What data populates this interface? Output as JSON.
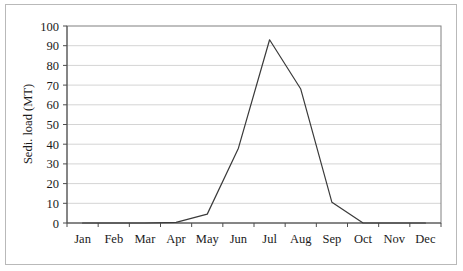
{
  "chart_data": {
    "type": "line",
    "title": "",
    "xlabel": "",
    "ylabel": "Sedi. load (MT)",
    "categories": [
      "Jan",
      "Feb",
      "Mar",
      "Apr",
      "May",
      "Jun",
      "Jul",
      "Aug",
      "Sep",
      "Oct",
      "Nov",
      "Dec"
    ],
    "values": [
      0,
      0,
      0,
      0.3,
      4.5,
      38,
      93,
      68,
      10.5,
      0,
      0,
      0
    ],
    "series": [
      {
        "name": "Sedi. load (MT)",
        "values": [
          0,
          0,
          0,
          0.3,
          4.5,
          38,
          93,
          68,
          10.5,
          0,
          0,
          0
        ]
      }
    ],
    "ylim": [
      0,
      100
    ],
    "ytick_labels": [
      "0",
      "10",
      "20",
      "30",
      "40",
      "50",
      "60",
      "70",
      "80",
      "90",
      "100"
    ],
    "ytick_values": [
      0,
      10,
      20,
      30,
      40,
      50,
      60,
      70,
      80,
      90,
      100
    ],
    "grid": "horizontal",
    "legend": "none",
    "line_color": "#3a3a3a",
    "grid_color": "#d4d4d4",
    "axis_color": "#808080",
    "background": "#ffffff"
  }
}
